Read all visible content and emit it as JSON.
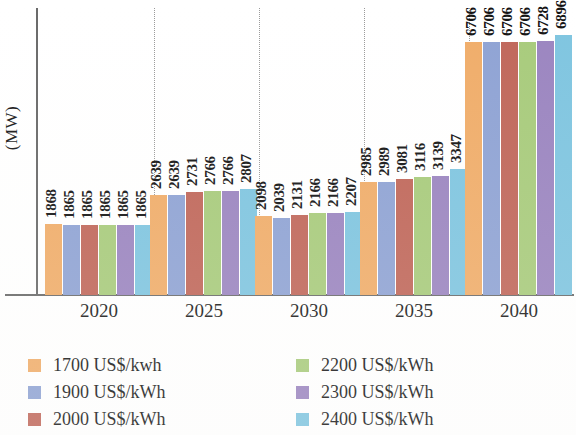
{
  "chart_data": {
    "type": "bar",
    "title": "",
    "xlabel": "",
    "ylabel": "(MW)",
    "categories": [
      "2020",
      "2025",
      "2030",
      "2035",
      "2040"
    ],
    "ylim": [
      0,
      7600
    ],
    "grid": false,
    "legend_position": "bottom",
    "series": [
      {
        "name": "1700 US$/kwh",
        "color": "#f0ad6a",
        "values": [
          1868,
          2639,
          2098,
          2985,
          6706
        ]
      },
      {
        "name": "1900 US$/kWh",
        "color": "#8fa3d4",
        "values": [
          1865,
          2639,
          2039,
          2989,
          6706
        ]
      },
      {
        "name": "2000 US$/kWh",
        "color": "#c0675a",
        "values": [
          1865,
          2731,
          2131,
          3081,
          6706
        ]
      },
      {
        "name": "2200 US$/kWh",
        "color": "#a8cb7c",
        "values": [
          1865,
          2766,
          2166,
          3116,
          6706
        ]
      },
      {
        "name": "2300 US$/kWh",
        "color": "#9b85c0",
        "values": [
          1865,
          2766,
          2166,
          3139,
          6728
        ]
      },
      {
        "name": "2400 US$/kWh",
        "color": "#7fc5e0",
        "values": [
          1865,
          2807,
          2207,
          3347,
          6896
        ]
      }
    ],
    "value_labels": [
      [
        "1868",
        "1865",
        "1865",
        "1865",
        "1865",
        "1865"
      ],
      [
        "2639",
        "2639",
        "2731",
        "2766",
        "2766",
        "2807"
      ],
      [
        "2098",
        "2039",
        "2131",
        "2166",
        "2166",
        "2207"
      ],
      [
        "2985",
        "2989",
        "3081",
        "3116",
        "3139",
        "3347"
      ],
      [
        "6706",
        "6706",
        "6706",
        "6706",
        "6728",
        "6896"
      ]
    ]
  },
  "axis": {
    "y_title": "(MW)",
    "x_tick_labels": [
      "2020",
      "2025",
      "2030",
      "2035",
      "2040"
    ]
  },
  "legend": {
    "items": [
      {
        "label": "1700 US$/kwh",
        "color": "#f0ad6a"
      },
      {
        "label": "2200 US$/kWh",
        "color": "#a8cb7c"
      },
      {
        "label": "1900 US$/kWh",
        "color": "#8fa3d4"
      },
      {
        "label": "2300 US$/kWh",
        "color": "#9b85c0"
      },
      {
        "label": "2000 US$/kWh",
        "color": "#c0675a"
      },
      {
        "label": "2400 US$/kWh",
        "color": "#7fc5e0"
      }
    ]
  }
}
